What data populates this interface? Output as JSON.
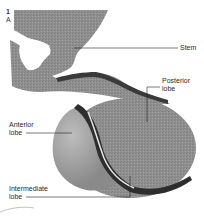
{
  "figure": {
    "number": "1",
    "panel": "A"
  },
  "labels": {
    "stem": "Stem",
    "posterior_line1": "Posterior",
    "posterior_line2": "lobe",
    "anterior_line1": "Anterior",
    "anterior_line2": "lobe",
    "intermediate_line1": "Intermediate",
    "intermediate_line2": "lobe"
  },
  "colors": {
    "tissue": "#8e8e8e",
    "tissue_light": "#a8a8a8",
    "dark_band": "#3a3a3a",
    "leader_line": "#222222"
  }
}
